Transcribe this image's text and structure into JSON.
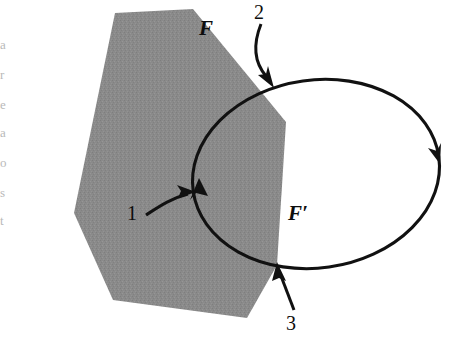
{
  "figure": {
    "width": 461,
    "height": 345,
    "background_color": "#ffffff",
    "polygon_fill_color": "#8a8a8a",
    "stroke_color": "#111111"
  },
  "labels": {
    "region_F": "F",
    "region_F_prime": "F′",
    "callout_1": "1",
    "callout_2": "2",
    "callout_3": "3"
  },
  "margin_fragments": [
    {
      "text": "a",
      "top": 38
    },
    {
      "text": "r",
      "top": 68
    },
    {
      "text": "e",
      "top": 98
    },
    {
      "text": "a",
      "top": 126
    },
    {
      "text": "o",
      "top": 156
    },
    {
      "text": "s",
      "top": 186
    },
    {
      "text": "t",
      "top": 214
    }
  ],
  "chart_data": {
    "type": "diagram",
    "shapes": [
      {
        "name": "polygon-F",
        "role": "shaded region",
        "label": "F",
        "fill": "#8a8a8a",
        "vertices": [
          [
            115,
            13
          ],
          [
            193,
            9
          ],
          [
            286,
            122
          ],
          [
            277,
            265
          ],
          [
            247,
            318
          ],
          [
            113,
            300
          ],
          [
            74,
            213
          ]
        ]
      },
      {
        "name": "ellipse-F-prime",
        "role": "oriented closed curve",
        "label": "F′",
        "fill": "none",
        "stroke": "#111111",
        "center": [
          316,
          174
        ],
        "radius_x": 124,
        "radius_y": 94,
        "rotation_deg": -8,
        "orientation": "clockwise"
      }
    ],
    "orientation_arrowheads": [
      {
        "name": "arrowhead-left",
        "at": [
          200,
          190
        ],
        "direction": "up"
      },
      {
        "name": "arrowhead-right",
        "at": [
          436,
          152
        ],
        "direction": "down"
      }
    ],
    "callouts": [
      {
        "id": "1",
        "label": "1",
        "points_to": "intersection point of F boundary and F′ on the left",
        "tail": [
          150,
          214
        ],
        "head": [
          196,
          193
        ]
      },
      {
        "id": "2",
        "label": "2",
        "points_to": "upper intersection of F′ with polygon top edge",
        "tail": [
          262,
          22
        ],
        "head": [
          272,
          84
        ]
      },
      {
        "id": "3",
        "label": "3",
        "points_to": "lower intersection of F′ with polygon right edge",
        "tail": [
          292,
          308
        ],
        "head": [
          279,
          263
        ]
      }
    ]
  }
}
